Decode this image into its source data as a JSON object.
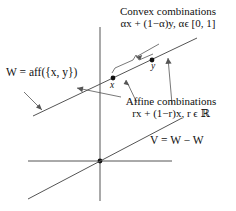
{
  "figure": {
    "ink_color": "#111111",
    "line_color": "#555555",
    "background": "#ffffff"
  },
  "annotations": {
    "convex": {
      "line1": "Convex combinations",
      "line2": "αx + (1−α)y, αϵ [0, 1]"
    },
    "affine": {
      "line1": "Affine combinations",
      "line2": "rx + (1−r)x, r ϵ ℝ"
    },
    "w_label": "W = aff({x, y})",
    "v_label": "V = W − W"
  },
  "points": [
    {
      "name": "x",
      "label": "x"
    },
    {
      "name": "y",
      "label": "y"
    }
  ]
}
